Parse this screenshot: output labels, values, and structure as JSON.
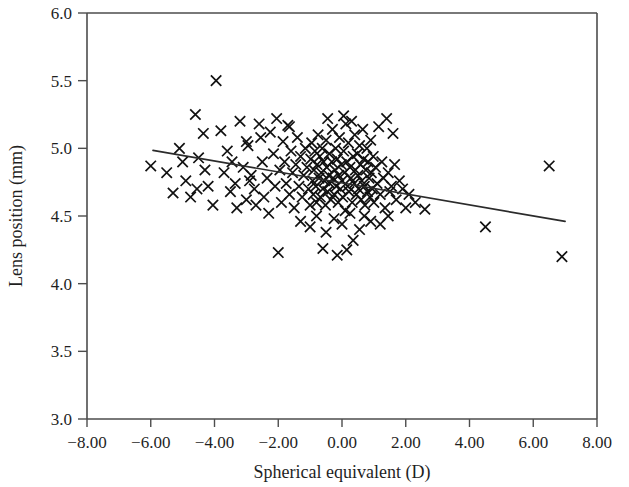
{
  "chart_data": {
    "type": "scatter",
    "title": "",
    "xlabel": "Spherical equivalent (D)",
    "ylabel": "Lens position (mm)",
    "xlim": [
      -8.0,
      8.0
    ],
    "ylim": [
      3.0,
      6.0
    ],
    "xticks": [
      -8.0,
      -6.0,
      -4.0,
      -2.0,
      0.0,
      2.0,
      4.0,
      6.0,
      8.0
    ],
    "yticks": [
      3.0,
      3.5,
      4.0,
      4.5,
      5.0,
      5.5,
      6.0
    ],
    "xtick_labels": [
      "−8.00",
      "−6.00",
      "−4.00",
      "−2.00",
      "0.00",
      "2.00",
      "4.00",
      "6.00",
      "8.00"
    ],
    "ytick_labels": [
      "3.0",
      "3.5",
      "4.0",
      "4.5",
      "5.0",
      "5.5",
      "6.0"
    ],
    "grid": false,
    "legend": null,
    "marker": "x",
    "marker_color": "#111111",
    "frame_color": "#4d4d4d",
    "regression_line": {
      "label": "fit-line",
      "color": "#2b2b2b",
      "x_start": -5.93,
      "y_start": 4.985,
      "x_end": 7.0,
      "y_end": 4.46
    },
    "series": [
      {
        "name": "eyes",
        "points": [
          [
            -6.0,
            4.87
          ],
          [
            -5.5,
            4.82
          ],
          [
            -5.3,
            4.67
          ],
          [
            -5.1,
            5.0
          ],
          [
            -4.9,
            4.76
          ],
          [
            -4.75,
            4.64
          ],
          [
            -4.6,
            5.25
          ],
          [
            -4.5,
            4.93
          ],
          [
            -4.35,
            5.11
          ],
          [
            -4.2,
            4.72
          ],
          [
            -4.05,
            4.58
          ],
          [
            -3.95,
            5.5
          ],
          [
            -3.8,
            5.13
          ],
          [
            -3.7,
            4.82
          ],
          [
            -3.6,
            4.98
          ],
          [
            -3.5,
            4.68
          ],
          [
            -3.35,
            4.74
          ],
          [
            -3.2,
            5.2
          ],
          [
            -3.1,
            4.86
          ],
          [
            -3.0,
            4.62
          ],
          [
            -2.95,
            5.02
          ],
          [
            -2.85,
            4.8
          ],
          [
            -2.75,
            4.7
          ],
          [
            -2.6,
            5.18
          ],
          [
            -2.5,
            4.9
          ],
          [
            -2.45,
            4.64
          ],
          [
            -2.35,
            4.78
          ],
          [
            -2.25,
            5.12
          ],
          [
            -2.15,
            4.96
          ],
          [
            -2.1,
            4.72
          ],
          [
            -2.05,
            5.22
          ],
          [
            -1.95,
            4.84
          ],
          [
            -1.9,
            4.6
          ],
          [
            -1.85,
            5.05
          ],
          [
            -1.8,
            4.9
          ],
          [
            -1.75,
            4.74
          ],
          [
            -1.7,
            5.17
          ],
          [
            -1.65,
            4.66
          ],
          [
            -1.6,
            4.98
          ],
          [
            -1.55,
            4.82
          ],
          [
            -1.5,
            4.56
          ],
          [
            -1.45,
            4.88
          ],
          [
            -1.4,
            5.08
          ],
          [
            -1.35,
            4.72
          ],
          [
            -1.3,
            4.94
          ],
          [
            -1.25,
            4.64
          ],
          [
            -1.2,
            4.8
          ],
          [
            -1.15,
            5.0
          ],
          [
            -1.1,
            4.86
          ],
          [
            -1.05,
            4.7
          ],
          [
            -1.0,
            4.58
          ],
          [
            -0.98,
            4.92
          ],
          [
            -0.95,
            5.04
          ],
          [
            -0.92,
            4.76
          ],
          [
            -0.9,
            4.66
          ],
          [
            -0.88,
            4.84
          ],
          [
            -0.85,
            4.98
          ],
          [
            -0.82,
            4.72
          ],
          [
            -0.8,
            4.6
          ],
          [
            -0.78,
            4.88
          ],
          [
            -0.75,
            5.1
          ],
          [
            -0.72,
            4.78
          ],
          [
            -0.7,
            4.94
          ],
          [
            -0.68,
            4.64
          ],
          [
            -0.65,
            4.82
          ],
          [
            -0.62,
            5.0
          ],
          [
            -0.6,
            4.7
          ],
          [
            -0.58,
            4.9
          ],
          [
            -0.55,
            4.76
          ],
          [
            -0.52,
            4.58
          ],
          [
            -0.5,
            5.06
          ],
          [
            -0.48,
            4.86
          ],
          [
            -0.45,
            4.68
          ],
          [
            -0.42,
            4.8
          ],
          [
            -0.4,
            4.96
          ],
          [
            -0.38,
            4.74
          ],
          [
            -0.35,
            4.62
          ],
          [
            -0.32,
            4.9
          ],
          [
            -0.3,
            5.14
          ],
          [
            -0.28,
            4.78
          ],
          [
            -0.25,
            4.66
          ],
          [
            -0.22,
            4.84
          ],
          [
            -0.2,
            5.0
          ],
          [
            -0.18,
            4.72
          ],
          [
            -0.15,
            4.92
          ],
          [
            -0.12,
            4.6
          ],
          [
            -0.1,
            4.8
          ],
          [
            -0.08,
            5.08
          ],
          [
            -0.05,
            4.7
          ],
          [
            -0.02,
            4.88
          ],
          [
            0.0,
            4.76
          ],
          [
            0.02,
            4.64
          ],
          [
            0.05,
            4.98
          ],
          [
            0.08,
            4.82
          ],
          [
            0.1,
            4.54
          ],
          [
            0.12,
            5.18
          ],
          [
            0.15,
            4.9
          ],
          [
            0.18,
            4.72
          ],
          [
            0.2,
            5.04
          ],
          [
            0.22,
            4.68
          ],
          [
            0.25,
            4.86
          ],
          [
            0.28,
            4.78
          ],
          [
            0.3,
            5.2
          ],
          [
            0.32,
            4.6
          ],
          [
            0.35,
            4.94
          ],
          [
            0.38,
            4.74
          ],
          [
            0.4,
            5.1
          ],
          [
            0.42,
            4.84
          ],
          [
            0.45,
            4.66
          ],
          [
            0.48,
            4.96
          ],
          [
            0.5,
            4.8
          ],
          [
            0.52,
            4.7
          ],
          [
            0.55,
            5.02
          ],
          [
            0.58,
            4.88
          ],
          [
            0.6,
            4.62
          ],
          [
            0.62,
            4.76
          ],
          [
            0.65,
            5.14
          ],
          [
            0.68,
            4.92
          ],
          [
            0.7,
            4.72
          ],
          [
            0.72,
            4.58
          ],
          [
            0.75,
            4.84
          ],
          [
            0.78,
            5.0
          ],
          [
            0.8,
            4.68
          ],
          [
            0.82,
            4.9
          ],
          [
            0.85,
            4.78
          ],
          [
            0.88,
            4.64
          ],
          [
            0.9,
            5.06
          ],
          [
            0.92,
            4.82
          ],
          [
            0.95,
            4.7
          ],
          [
            0.98,
            4.94
          ],
          [
            1.0,
            4.6
          ],
          [
            1.05,
            4.86
          ],
          [
            1.1,
            4.74
          ],
          [
            1.15,
            5.16
          ],
          [
            1.2,
            4.66
          ],
          [
            1.25,
            4.9
          ],
          [
            1.3,
            4.78
          ],
          [
            1.35,
            4.56
          ],
          [
            1.4,
            5.22
          ],
          [
            1.45,
            4.82
          ],
          [
            1.5,
            4.68
          ],
          [
            1.55,
            4.72
          ],
          [
            1.6,
            5.11
          ],
          [
            1.65,
            4.88
          ],
          [
            1.7,
            4.62
          ],
          [
            1.8,
            4.76
          ],
          [
            1.9,
            4.7
          ],
          [
            2.0,
            4.56
          ],
          [
            2.1,
            4.66
          ],
          [
            2.3,
            4.6
          ],
          [
            2.6,
            4.55
          ],
          [
            4.5,
            4.42
          ],
          [
            6.5,
            4.87
          ],
          [
            6.9,
            4.2
          ],
          [
            -2.0,
            4.23
          ],
          [
            -0.6,
            4.26
          ],
          [
            -0.15,
            4.21
          ],
          [
            0.15,
            4.25
          ],
          [
            0.35,
            4.32
          ],
          [
            -1.0,
            4.42
          ],
          [
            -0.5,
            4.38
          ],
          [
            0.0,
            4.44
          ],
          [
            0.55,
            4.4
          ],
          [
            0.9,
            4.46
          ],
          [
            -1.3,
            4.46
          ],
          [
            -0.8,
            4.5
          ],
          [
            -0.25,
            4.48
          ],
          [
            0.25,
            4.52
          ],
          [
            0.7,
            4.5
          ],
          [
            -2.3,
            4.52
          ],
          [
            -2.7,
            4.58
          ],
          [
            -3.3,
            4.56
          ],
          [
            1.2,
            4.44
          ],
          [
            1.45,
            4.5
          ],
          [
            -0.45,
            5.22
          ],
          [
            0.05,
            5.24
          ],
          [
            -1.65,
            5.16
          ],
          [
            -2.55,
            5.08
          ],
          [
            -3.0,
            5.05
          ],
          [
            -4.3,
            4.84
          ],
          [
            -5.0,
            4.9
          ],
          [
            -4.55,
            4.7
          ],
          [
            -3.45,
            4.9
          ],
          [
            -2.9,
            4.76
          ]
        ]
      }
    ]
  },
  "axes": {
    "x_title": "Spherical equivalent (D)",
    "y_title": "Lens position (mm)"
  }
}
